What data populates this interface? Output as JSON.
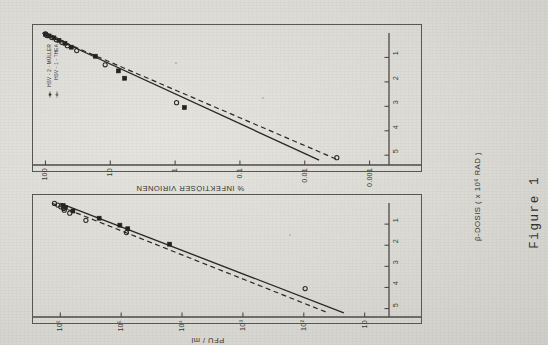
{
  "figure": {
    "caption": "Figure 1",
    "legend": {
      "entries": [
        {
          "marker": "filled-square",
          "line": "solid",
          "label": "HSV - 2 - MÜLLER"
        },
        {
          "marker": "open-circle",
          "line": "dashed",
          "label": "HSV - 1 - THEA"
        }
      ]
    },
    "shared_x_axis_title": "β-DOSIS ( x 10⁶ RAD )"
  },
  "chart_data": [
    {
      "id": "panel-upper",
      "type": "scatter",
      "title": "",
      "xlabel": "β-DOSIS ( x 10⁶ RAD )",
      "ylabel": "% INFEKTIÖSER VIRIONEN",
      "xlim": [
        0,
        5.4
      ],
      "ylim_log10": [
        -3.3,
        2.1
      ],
      "xticks": [
        1,
        2,
        3,
        4,
        5
      ],
      "xticklabels": [
        "1",
        "2",
        "3",
        "4",
        "5"
      ],
      "yticks": [
        100,
        10,
        1,
        0.1,
        0.01,
        0.001
      ],
      "yticklabels": [
        "100",
        "10",
        "1",
        "0.1",
        "0.01",
        "0.001"
      ],
      "yscale": "log",
      "grid": false,
      "legend_position": "top-left",
      "series": [
        {
          "name": "HSV - 2 - MÜLLER",
          "marker": "filled-square",
          "linestyle": "solid",
          "points": [
            {
              "x": 0.05,
              "y": 100
            },
            {
              "x": 0.12,
              "y": 88
            },
            {
              "x": 0.2,
              "y": 74
            },
            {
              "x": 0.3,
              "y": 62
            },
            {
              "x": 0.42,
              "y": 50
            },
            {
              "x": 0.58,
              "y": 40
            },
            {
              "x": 0.95,
              "y": 17
            },
            {
              "x": 1.55,
              "y": 7.5
            },
            {
              "x": 1.85,
              "y": 6.0
            },
            {
              "x": 3.05,
              "y": 0.72
            }
          ],
          "fit_line": {
            "x0": 0.0,
            "y0": 110,
            "x1": 5.2,
            "y1": 0.006
          }
        },
        {
          "name": "HSV - 1 - THEA",
          "marker": "open-circle",
          "linestyle": "dashed",
          "points": [
            {
              "x": 0.04,
              "y": 100
            },
            {
              "x": 0.1,
              "y": 95
            },
            {
              "x": 0.18,
              "y": 80
            },
            {
              "x": 0.28,
              "y": 68
            },
            {
              "x": 0.38,
              "y": 56
            },
            {
              "x": 0.52,
              "y": 46
            },
            {
              "x": 0.72,
              "y": 33
            },
            {
              "x": 1.3,
              "y": 12
            },
            {
              "x": 2.85,
              "y": 0.95
            },
            {
              "x": 5.1,
              "y": 0.0032
            }
          ],
          "fit_line": {
            "x0": 0.0,
            "y0": 112,
            "x1": 5.2,
            "y1": 0.003
          }
        }
      ]
    },
    {
      "id": "panel-lower",
      "type": "scatter",
      "title": "",
      "xlabel": "β-DOSIS ( x 10⁶ RAD )",
      "ylabel": "PFU / ml",
      "xlim": [
        0,
        5.4
      ],
      "ylim_log10": [
        0.6,
        6.35
      ],
      "xticks": [
        1,
        2,
        3,
        4,
        5
      ],
      "xticklabels": [
        "1",
        "2",
        "3",
        "4",
        "5"
      ],
      "yticks": [
        1000000,
        100000,
        10000,
        1000,
        100,
        10
      ],
      "yticklabels": [
        "10⁶",
        "10⁵",
        "10⁴",
        "10³",
        "10²",
        "10"
      ],
      "yscale": "log",
      "grid": false,
      "legend_position": "none",
      "series": [
        {
          "name": "HSV - 2 - MÜLLER",
          "marker": "filled-square",
          "linestyle": "solid",
          "points": [
            {
              "x": 0.12,
              "y": 900000
            },
            {
              "x": 0.22,
              "y": 820000
            },
            {
              "x": 0.38,
              "y": 620000
            },
            {
              "x": 0.72,
              "y": 230000
            },
            {
              "x": 1.05,
              "y": 105000
            },
            {
              "x": 1.22,
              "y": 78000
            },
            {
              "x": 1.95,
              "y": 16000
            }
          ],
          "fit_line": {
            "x0": 0.02,
            "y0": 1000000,
            "x1": 5.2,
            "y1": 22
          }
        },
        {
          "name": "HSV - 1 - THEA",
          "marker": "open-circle",
          "linestyle": "dashed",
          "points": [
            {
              "x": 0.02,
              "y": 1250000
            },
            {
              "x": 0.1,
              "y": 1100000
            },
            {
              "x": 0.18,
              "y": 980000
            },
            {
              "x": 0.26,
              "y": 880000
            },
            {
              "x": 0.34,
              "y": 860000
            },
            {
              "x": 0.48,
              "y": 700000
            },
            {
              "x": 0.82,
              "y": 380000
            },
            {
              "x": 1.4,
              "y": 82000
            },
            {
              "x": 4.05,
              "y": 95
            }
          ],
          "fit_line": {
            "x0": 0.02,
            "y0": 1350000,
            "x1": 5.2,
            "y1": 40
          }
        }
      ]
    }
  ]
}
